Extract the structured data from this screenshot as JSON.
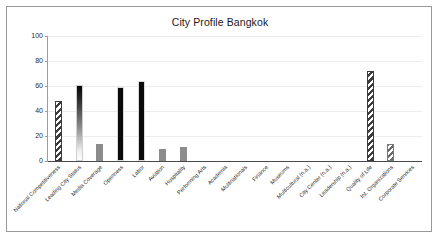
{
  "chart_data": {
    "type": "bar",
    "title": "City Profile Bangkok",
    "xlabel": "",
    "ylabel": "",
    "ylim": [
      0,
      100
    ],
    "yticks": [
      0,
      20,
      40,
      60,
      80,
      100
    ],
    "grid": true,
    "legend": "none",
    "categories": [
      "National Competitiveness",
      "Leading City Status",
      "Media Coverage",
      "Openness",
      "Labor",
      "Aviation",
      "Hospitality",
      "Performing Arts",
      "Academia",
      "Multinationals",
      "Finance",
      "Museums",
      "Multicultural (n.a.)",
      "City Center (n.a.)",
      "Leadership (n.a.)",
      "Quality of Life",
      "Int. Organizations",
      "Corporate Services"
    ],
    "values": [
      48,
      61,
      14,
      59,
      64,
      10,
      11,
      0,
      0,
      0,
      0,
      0,
      0,
      0,
      0,
      72,
      14,
      0
    ],
    "bar_styles": [
      "hatch",
      "gradient",
      "solid-gray",
      "solid-black",
      "solid-black",
      "solid-gray",
      "solid-gray",
      "none",
      "none",
      "none",
      "none",
      "none",
      "none",
      "none",
      "none",
      "hatch",
      "hatch-lt",
      "none"
    ]
  },
  "axis": {
    "y_tick_labels": [
      "0",
      "20",
      "40",
      "60",
      "80",
      "100"
    ]
  }
}
